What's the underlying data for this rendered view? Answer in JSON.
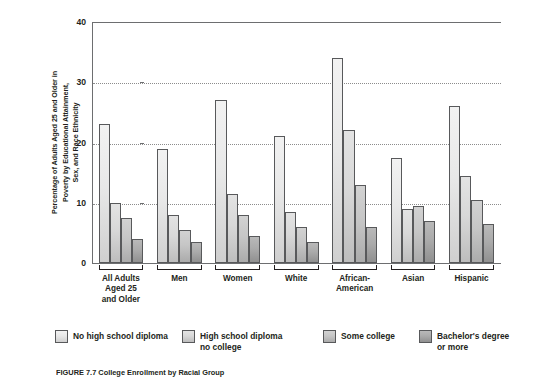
{
  "chart_data": {
    "type": "bar",
    "title": "",
    "xlabel": "",
    "ylabel": "Percentage of Adults Aged 25 and Older in\nPoverty by Educational Attainment,\nSex, and Race Ethnicity",
    "ylim": [
      0,
      40
    ],
    "yticks": [
      0,
      10,
      20,
      30,
      40
    ],
    "ytick_labels": [
      "0",
      "10",
      "20",
      "30",
      "40"
    ],
    "grid": "horizontal-dotted",
    "legend_position": "bottom",
    "categories": [
      "All Adults\nAged 25\nand Older",
      "Men",
      "Women",
      "White",
      "African-\nAmerican",
      "Asian",
      "Hispanic"
    ],
    "series": [
      {
        "name": "No high school diploma",
        "color": "#eaeaea",
        "values": [
          23,
          19,
          27,
          21,
          34,
          17.5,
          26
        ]
      },
      {
        "name": "High school diploma\nno college",
        "color": "#d8d8d8",
        "values": [
          10,
          8,
          11.5,
          8.5,
          22,
          9,
          14.5
        ]
      },
      {
        "name": "Some college",
        "color": "#c6c6c6",
        "values": [
          7.5,
          5.5,
          8,
          6,
          13,
          9.5,
          10.5
        ]
      },
      {
        "name": "Bachelor's degree\nor more",
        "color": "#aaaaaa",
        "values": [
          4,
          3.5,
          4.5,
          3.5,
          6,
          7,
          6.5
        ]
      }
    ]
  },
  "figure": {
    "caption": "FIGURE 7.7  College Enrollment by Racial Group"
  }
}
